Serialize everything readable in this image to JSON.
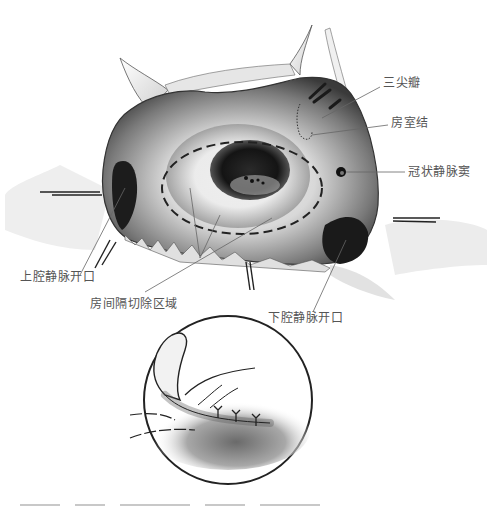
{
  "figure": {
    "labels": {
      "tricuspid_valve": "三尖瓣",
      "av_node": "房室结",
      "coronary_sinus": "冠状静脉窦",
      "svc_opening": "上腔静脉开口",
      "septum_excision_area": "房间隔切除区域",
      "ivc_opening": "下腔静脉开口"
    },
    "inset": {
      "description": "缝合示意圆形插图"
    },
    "colors": {
      "ink": "#222222",
      "label_text": "#555555",
      "leader_line": "#666666",
      "background": "#ffffff"
    }
  }
}
